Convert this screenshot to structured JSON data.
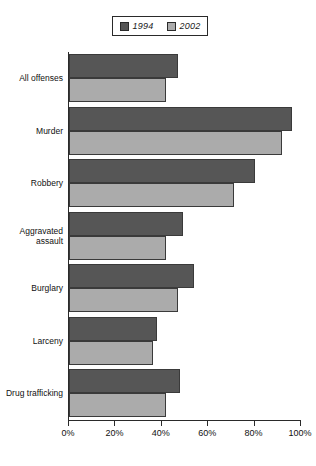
{
  "chart_data": {
    "type": "bar",
    "orientation": "horizontal",
    "title": "",
    "xlabel": "",
    "ylabel": "",
    "xlim": [
      0,
      100
    ],
    "xticks": [
      0,
      20,
      40,
      60,
      80,
      100
    ],
    "xtick_labels": [
      "0%",
      "20%",
      "40%",
      "60%",
      "80%",
      "100%"
    ],
    "grid": false,
    "legend_position": "top-center",
    "categories": [
      "All offenses",
      "Murder",
      "Robbery",
      "Aggravated assault",
      "Burglary",
      "Larceny",
      "Drug trafficking"
    ],
    "category_lines": [
      [
        "All offenses"
      ],
      [
        "Murder"
      ],
      [
        "Robbery"
      ],
      [
        "Aggravated",
        "assault"
      ],
      [
        "Burglary"
      ],
      [
        "Larceny"
      ],
      [
        "Drug trafficking"
      ]
    ],
    "series": [
      {
        "name": "1994",
        "color": "#565656",
        "values": [
          47,
          96,
          80,
          49,
          54,
          38,
          48
        ]
      },
      {
        "name": "2002",
        "color": "#ababab",
        "values": [
          42,
          92,
          71,
          42,
          47,
          36,
          42
        ]
      }
    ]
  },
  "legend": {
    "entries": [
      {
        "label": "1994",
        "color": "#565656"
      },
      {
        "label": "2002",
        "color": "#ababab"
      }
    ]
  },
  "axis": {
    "tick_labels": [
      "0%",
      "20%",
      "40%",
      "60%",
      "80%",
      "100%"
    ]
  }
}
